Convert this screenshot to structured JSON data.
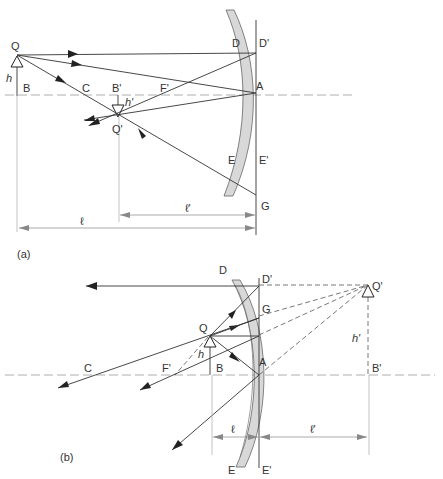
{
  "diagram": {
    "type": "concave-mirror-ray-diagram",
    "panels": [
      {
        "id": "a",
        "caption": "(a)",
        "labels": {
          "object_tip": "Q",
          "object_base": "B",
          "object_height": "h",
          "center": "C",
          "image_base": "B'",
          "image_height": "h'",
          "image_tip": "Q'",
          "focus": "F'",
          "mirror_top": "D",
          "mirror_top_plane": "D'",
          "vertex": "A",
          "mirror_bottom": "E",
          "mirror_bottom_plane": "E'",
          "ray_point": "G",
          "object_distance": "ℓ",
          "image_distance": "ℓ'"
        }
      },
      {
        "id": "b",
        "caption": "(b)",
        "labels": {
          "mirror_top": "D",
          "mirror_top_plane": "D'",
          "image_tip": "Q'",
          "ray_point": "G",
          "object_tip": "Q",
          "object_height": "h",
          "image_height": "h'",
          "center": "C",
          "focus": "F'",
          "object_base": "B",
          "vertex": "A",
          "image_base": "B'",
          "object_distance": "ℓ",
          "image_distance": "ℓ'",
          "mirror_bottom": "E",
          "mirror_bottom_plane": "E'"
        }
      }
    ]
  }
}
